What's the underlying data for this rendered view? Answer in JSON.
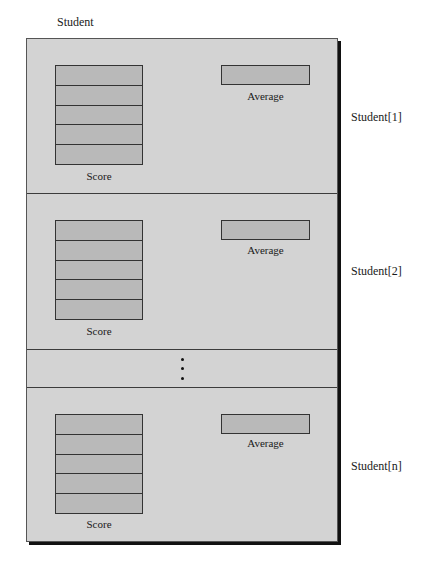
{
  "diagram": {
    "title": "Student",
    "colors": {
      "panel": "#d3d3d3",
      "cell": "#b9b9b9",
      "border": "#333333",
      "shadow": "#111111"
    },
    "records": [
      {
        "label": "Student[1]",
        "score_label": "Score",
        "average_label": "Average",
        "score_cells": 5
      },
      {
        "label": "Student[2]",
        "score_label": "Score",
        "average_label": "Average",
        "score_cells": 5
      },
      {
        "label": "Student[n]",
        "score_label": "Score",
        "average_label": "Average",
        "score_cells": 5
      }
    ],
    "ellipsis": "vertical-ellipsis"
  }
}
